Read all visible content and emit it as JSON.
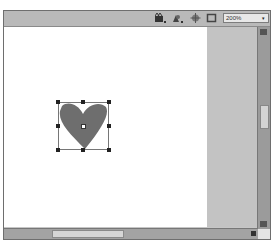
{
  "toolbar": {
    "icons": [
      {
        "name": "edit-scene-icon"
      },
      {
        "name": "edit-symbols-icon"
      },
      {
        "name": "center-stage-icon"
      },
      {
        "name": "clip-stage-icon"
      }
    ],
    "zoom": {
      "value": "200%",
      "arrow": "▾"
    }
  },
  "stage": {
    "background": "#ffffff",
    "pasteboard": "#c3c3c3"
  },
  "shape": {
    "type": "heart",
    "fill": "#6e6e6e",
    "selected": true
  },
  "scrollbars": {
    "vertical": {
      "thumb_position": "middle"
    },
    "horizontal": {
      "thumb_position": "left"
    }
  }
}
